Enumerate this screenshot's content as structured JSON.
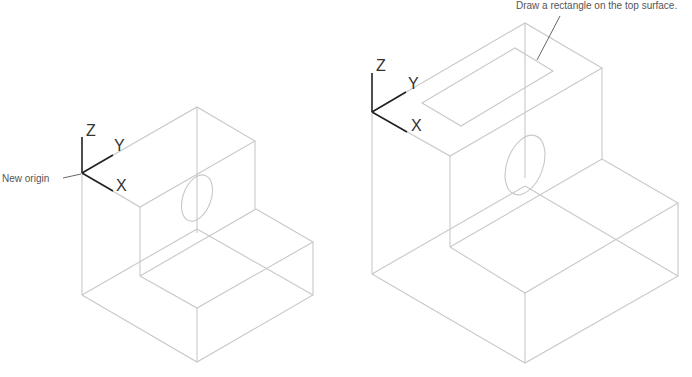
{
  "figures": [
    {
      "name": "left",
      "callout": "New origin",
      "axes": {
        "x": "X",
        "y": "Y",
        "z": "Z"
      }
    },
    {
      "name": "right",
      "callout": "Draw a rectangle on the top surface.",
      "axes": {
        "x": "X",
        "y": "Y",
        "z": "Z"
      }
    }
  ],
  "colors": {
    "edge": "#c8c8c8",
    "axis": "#222222",
    "text": "#555555"
  }
}
